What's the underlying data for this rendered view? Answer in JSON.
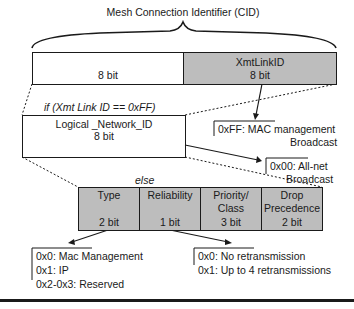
{
  "title": "Mesh Connection Identifier (CID)",
  "top_field": {
    "left": {
      "label": "",
      "size": "8 bit"
    },
    "right": {
      "label": "XmtLinkID",
      "size": "8 bit"
    }
  },
  "condition_label": "if (Xmt Link ID == 0xFF)",
  "logical_field": {
    "label": "Logical _Network_ID",
    "size": "8 bit"
  },
  "else_label": "else",
  "annotations": {
    "mac_mgmt": {
      "line1": "0xFF: MAC management",
      "line2": "Broadcast"
    },
    "all_net": {
      "line1": "0x00: All-net",
      "line2": "Broadcast"
    }
  },
  "sub_fields": [
    {
      "label": "Type",
      "label2": "",
      "size": "2 bit"
    },
    {
      "label": "Reliability",
      "label2": "",
      "size": "1 bit"
    },
    {
      "label": "Priority/",
      "label2": "Class",
      "size": "3 bit"
    },
    {
      "label": "Drop",
      "label2": "Precedence",
      "size": "2 bit"
    }
  ],
  "type_values": [
    "0x0: Mac Management",
    "0x1: IP",
    "0x2-0x3: Reserved"
  ],
  "reliability_values": [
    "0x0: No retransmission",
    "0x1: Up to 4 retransmissions"
  ],
  "colors": {
    "field_gray": "#bdbdbd",
    "line": "#1a1a1a"
  }
}
